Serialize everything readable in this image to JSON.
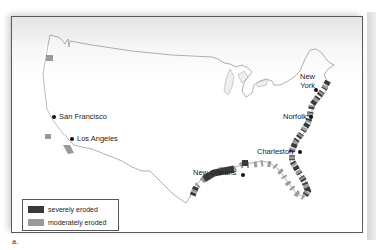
{
  "figure": {
    "panel_label": "a.",
    "colors": {
      "severe": "#3a3a3a",
      "moderate": "#9a9a9a",
      "land": "#ffffff",
      "outside": "#eeeeee",
      "coastline": "#6a6a6a"
    }
  },
  "map": {
    "cities": [
      {
        "name": "San Francisco",
        "label": "San Francisco"
      },
      {
        "name": "Los Angeles",
        "label": "Los Angeles"
      },
      {
        "name": "New York",
        "label_line1": "New",
        "label_line2": "York"
      },
      {
        "name": "Norfolk",
        "label": "Norfolk"
      },
      {
        "name": "Charleston",
        "label": "Charleston"
      },
      {
        "name": "New Orleans",
        "label": "New Orleans"
      }
    ]
  },
  "legend": {
    "items": [
      {
        "label": "severely eroded",
        "color": "#3a3a3a"
      },
      {
        "label": "moderately eroded",
        "color": "#9a9a9a"
      }
    ]
  }
}
